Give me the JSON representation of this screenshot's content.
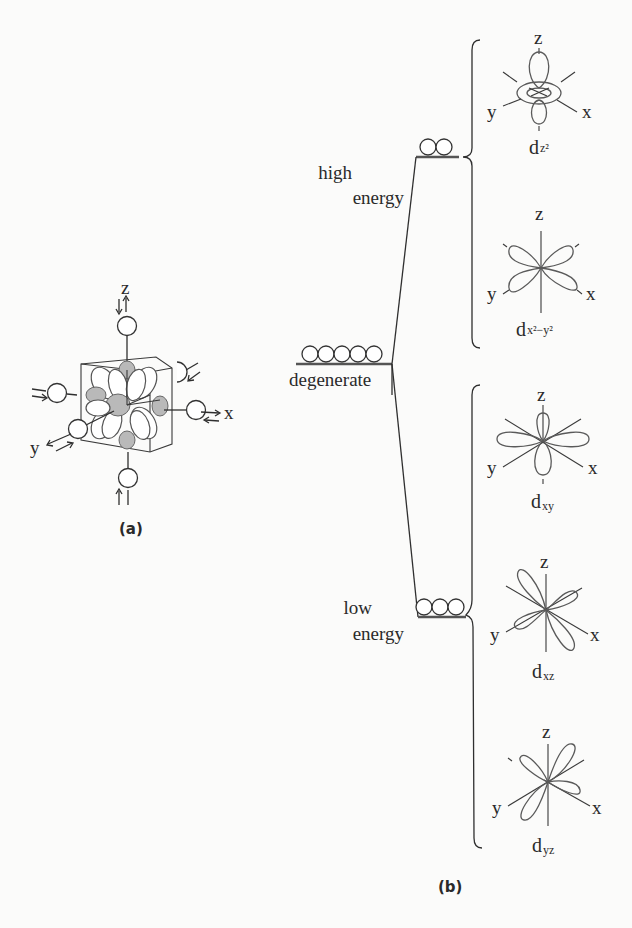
{
  "figure": {
    "panel_a": {
      "label": "(a)",
      "axes": {
        "x": "x",
        "y": "y",
        "z": "z"
      }
    },
    "panel_b": {
      "label": "(b)",
      "levels": {
        "high": {
          "line1": "high",
          "line2": "energy",
          "electron_count": 2
        },
        "degenerate": {
          "label": "degenerate",
          "electron_count": 5
        },
        "low": {
          "line1": "low",
          "line2": "energy",
          "electron_count": 3
        }
      },
      "orbitals": [
        {
          "name": "d",
          "sub": "z²",
          "group": "high"
        },
        {
          "name": "d",
          "sub": "x²−y²",
          "group": "high"
        },
        {
          "name": "d",
          "sub": "xy",
          "group": "low"
        },
        {
          "name": "d",
          "sub": "xz",
          "group": "low"
        },
        {
          "name": "d",
          "sub": "yz",
          "group": "low"
        }
      ],
      "axis_labels": {
        "x": "x",
        "y": "y",
        "z": "z"
      }
    }
  }
}
